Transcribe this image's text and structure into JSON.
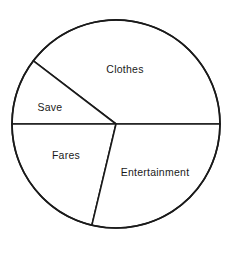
{
  "chart_data": {
    "type": "pie",
    "title": "",
    "subtitle": "",
    "xlabel": "",
    "ylabel": "",
    "legend": "none",
    "grid": false,
    "labels_inside_slices": true,
    "categories": [
      "Clothes",
      "Entertainment",
      "Fares",
      "Save"
    ],
    "values": [
      39.6,
      28.7,
      21.3,
      10.4
    ],
    "units": "percent",
    "slices": [
      {
        "label": "Clothes",
        "value": 39.6,
        "start_angle_deg": 0,
        "end_angle_deg": 142.6,
        "sweep_deg": 142.6,
        "fill": "#ffffff",
        "stroke": "#1a1a1a",
        "label_x": 125,
        "label_y": 69
      },
      {
        "label": "Save",
        "value": 10.4,
        "start_angle_deg": 142.6,
        "end_angle_deg": 180,
        "sweep_deg": 37.4,
        "fill": "#ffffff",
        "stroke": "#1a1a1a",
        "label_x": 50,
        "label_y": 107
      },
      {
        "label": "Fares",
        "value": 21.3,
        "start_angle_deg": 180,
        "end_angle_deg": 256.6,
        "sweep_deg": 76.6,
        "fill": "#ffffff",
        "stroke": "#1a1a1a",
        "label_x": 66,
        "label_y": 155
      },
      {
        "label": "Entertainment",
        "value": 28.7,
        "start_angle_deg": 256.6,
        "end_angle_deg": 360,
        "sweep_deg": 103.4,
        "fill": "#ffffff",
        "stroke": "#1a1a1a",
        "label_x": 155,
        "label_y": 172
      }
    ],
    "geometry": {
      "center_x": 116,
      "center_y": 124,
      "radius": 104
    },
    "colors": {
      "background": "#ffffff",
      "outline": "#1a1a1a",
      "text": "#1a1a1a"
    }
  }
}
